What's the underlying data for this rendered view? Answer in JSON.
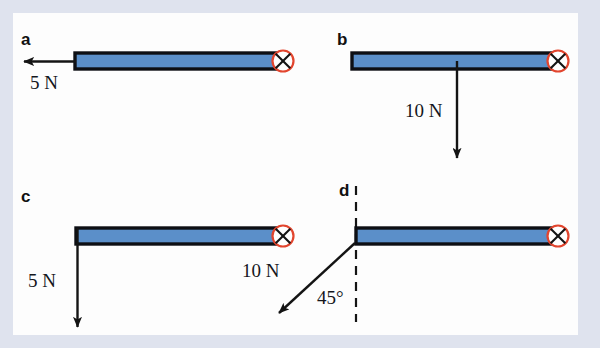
{
  "figure": {
    "background_color": "#dfe3ee",
    "card_color": "#fdfdfd",
    "bar_fill_color": "#5b8fc9",
    "bar_stroke_color": "#0d0f14",
    "pivot_ring_color": "#e2452e",
    "arrow_color": "#141414",
    "panels": [
      {
        "id": "a",
        "letter": "a",
        "force_label": "5 N",
        "force_magnitude": 5,
        "force_unit": "N",
        "force_direction": "left",
        "application_point": "left-end",
        "pivot": "right-end",
        "pivot_symbol": "cross-in-circle"
      },
      {
        "id": "b",
        "letter": "b",
        "force_label": "10 N",
        "force_magnitude": 10,
        "force_unit": "N",
        "force_direction": "down",
        "application_point": "middle",
        "pivot": "right-end",
        "pivot_symbol": "cross-in-circle"
      },
      {
        "id": "c",
        "letter": "c",
        "force_label": "5 N",
        "force_magnitude": 5,
        "force_unit": "N",
        "force_direction": "down",
        "application_point": "left-end",
        "pivot": "right-end",
        "pivot_symbol": "cross-in-circle"
      },
      {
        "id": "d",
        "letter": "d",
        "force_label": "10 N",
        "force_magnitude": 10,
        "force_unit": "N",
        "force_direction": "down-left-diagonal",
        "angle_label": "45°",
        "angle_value": 45,
        "angle_reference": "vertical-dashed-line",
        "application_point": "left-end",
        "pivot": "right-end",
        "pivot_symbol": "cross-in-circle"
      }
    ]
  }
}
